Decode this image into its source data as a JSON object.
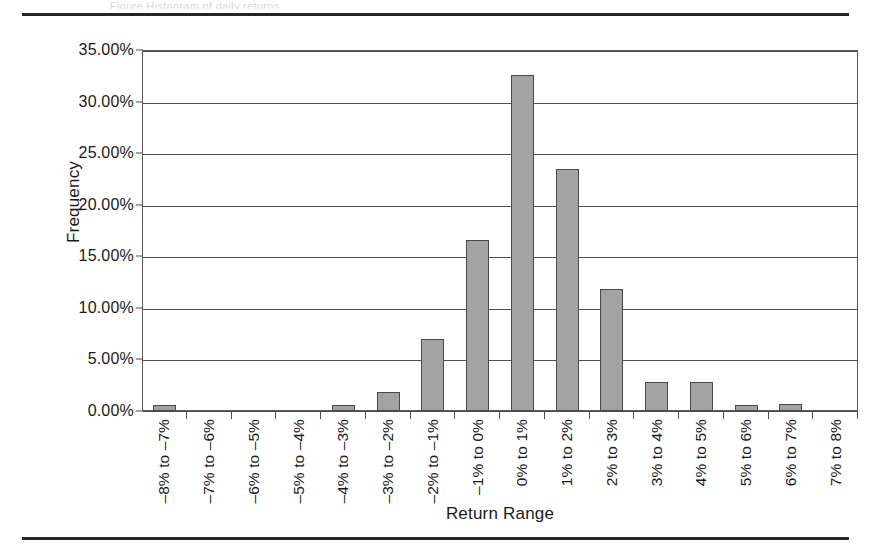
{
  "page": {
    "top_rule": true,
    "bottom_rule": true,
    "cropped_caption_fragment": "Figure   Histogram of daily returns"
  },
  "chart_data": {
    "type": "bar",
    "title": "",
    "xlabel": "Return Range",
    "ylabel": "Frequency",
    "ylim": [
      0,
      35
    ],
    "ytick_labels": [
      "35.00%",
      "30.00%",
      "25.00%",
      "20.00%",
      "15.00%",
      "10.00%",
      "5.00%",
      "0.00%"
    ],
    "ytick_values": [
      35,
      30,
      25,
      20,
      15,
      10,
      5,
      0
    ],
    "grid": true,
    "legend": null,
    "bar_color": "#a3a3a3",
    "bar_edge_color": "#4a4a4a",
    "categories": [
      "–8% to –7%",
      "–7% to –6%",
      "–6% to –5%",
      "–5% to –4%",
      "–4% to –3%",
      "–3% to –2%",
      "–2% to –1%",
      "–1% to 0%",
      "0% to 1%",
      "1% to 2%",
      "2% to 3%",
      "3% to 4%",
      "4% to 5%",
      "5% to 6%",
      "6% to 7%",
      "7% to 8%"
    ],
    "values": [
      0.6,
      0.0,
      0.0,
      0.0,
      0.6,
      1.8,
      7.0,
      16.6,
      32.6,
      23.5,
      11.8,
      2.8,
      2.8,
      0.6,
      0.7,
      0.0
    ]
  }
}
